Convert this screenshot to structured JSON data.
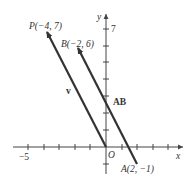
{
  "figure": {
    "axes": {
      "x_label": "x",
      "y_label": "y",
      "origin_label": "O",
      "x_tick_label": "−5",
      "y_tick_label": "7",
      "x_range": [
        -6,
        6
      ],
      "y_range": [
        -2,
        8
      ]
    },
    "points": {
      "P": {
        "label": "P(−4, 7)",
        "x": -4,
        "y": 7
      },
      "B": {
        "label": "B(−2, 6)",
        "x": -2,
        "y": 6
      },
      "A": {
        "label": "A(2, −1)",
        "x": 2,
        "y": -1
      },
      "O": {
        "label": "O",
        "x": 0,
        "y": 0
      }
    },
    "vectors": {
      "v": {
        "label": "v",
        "from": "O",
        "to": "P"
      },
      "AB": {
        "label": "AB",
        "from": "A",
        "to": "B"
      }
    },
    "colors": {
      "vector": "#333333",
      "axis": "#444444",
      "text": "#333333"
    }
  }
}
